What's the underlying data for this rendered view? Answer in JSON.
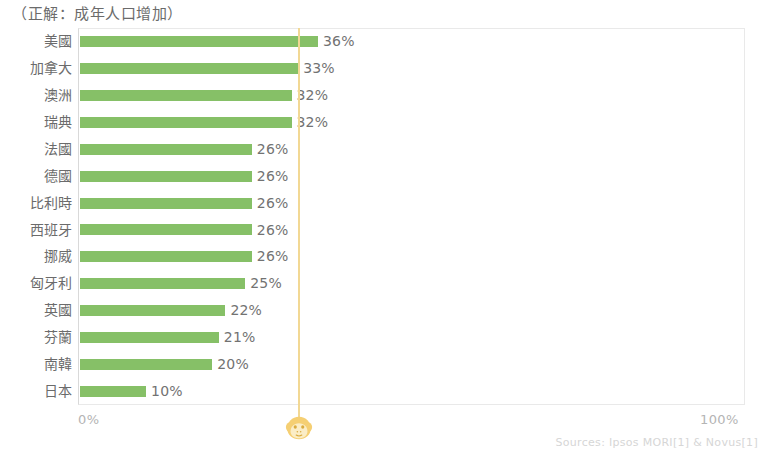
{
  "title": "（正解：成年人口增加）",
  "axis": {
    "min_label": "0%",
    "max_label": "100%"
  },
  "source_note": "Sources: Ipsos MORI[1] & Novus[1]",
  "reference": {
    "value": 33,
    "color": "#f2d894",
    "icon": "monkey-face-icon"
  },
  "colors": {
    "bar": "#7cbb5a",
    "reference_line": "#f2d894",
    "text": "#6b6b6b",
    "axis_text": "#b4b4b4",
    "source_text": "#d6d6d6"
  },
  "chart_data": {
    "type": "bar",
    "orientation": "horizontal",
    "title": "（正解：成年人口增加）",
    "xlabel": "",
    "ylabel": "",
    "xlim": [
      0,
      100
    ],
    "grid": false,
    "legend": false,
    "categories": [
      "美國",
      "加拿大",
      "澳洲",
      "瑞典",
      "法國",
      "德國",
      "比利時",
      "西班牙",
      "挪威",
      "匈牙利",
      "英國",
      "芬蘭",
      "南韓",
      "日本"
    ],
    "values": [
      36,
      33,
      32,
      32,
      26,
      26,
      26,
      26,
      26,
      25,
      22,
      21,
      20,
      10
    ],
    "value_labels": [
      "36%",
      "33%",
      "32%",
      "32%",
      "26%",
      "26%",
      "26%",
      "26%",
      "26%",
      "25%",
      "22%",
      "21%",
      "20%",
      "10%"
    ],
    "annotations": [
      {
        "type": "vline",
        "value": 33,
        "label": ""
      }
    ]
  }
}
